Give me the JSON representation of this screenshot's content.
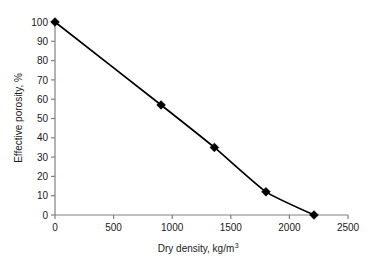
{
  "chart_data": {
    "type": "line",
    "title": "",
    "xlabel": "Dry density, kg/m",
    "xlabel_superscript": "3",
    "xlabel_full": "Dry density, kg/m3",
    "ylabel": "Effective porosity, %",
    "xlim": [
      0,
      2500
    ],
    "ylim": [
      0,
      100
    ],
    "x_ticks": [
      0,
      500,
      1000,
      1500,
      2000,
      2500
    ],
    "x_tick_labels": [
      "0",
      "500",
      "1000",
      "1500",
      "2000",
      "2500"
    ],
    "y_ticks": [
      0,
      10,
      20,
      30,
      40,
      50,
      60,
      70,
      80,
      90,
      100
    ],
    "y_tick_labels": [
      "0",
      "10",
      "20",
      "30",
      "40",
      "50",
      "60",
      "70",
      "80",
      "90",
      "100"
    ],
    "grid": false,
    "legend": false,
    "legend_position": "none",
    "marker": "diamond",
    "line_color": "#000000",
    "marker_color": "#000000",
    "axis_color": "#808080",
    "smoothing": "spline",
    "x": [
      0,
      905,
      1360,
      1800,
      2210
    ],
    "y": [
      100,
      57,
      35,
      12,
      0
    ],
    "series": [
      {
        "name": "Effective porosity",
        "points": [
          {
            "x": 0,
            "y": 100
          },
          {
            "x": 905,
            "y": 57
          },
          {
            "x": 1360,
            "y": 35
          },
          {
            "x": 1800,
            "y": 12
          },
          {
            "x": 2210,
            "y": 0
          }
        ]
      }
    ]
  },
  "layout": {
    "plot_left": 55,
    "plot_right": 348,
    "plot_top": 22,
    "plot_bottom": 215
  }
}
